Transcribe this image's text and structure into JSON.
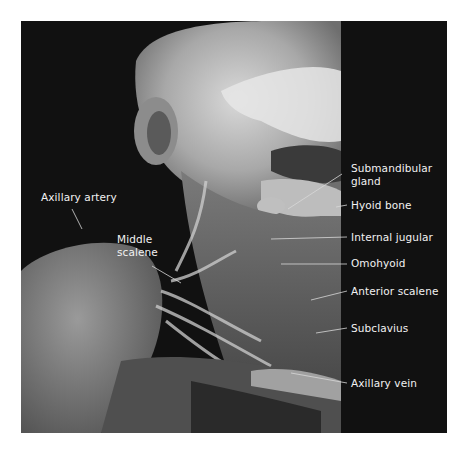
{
  "figure": {
    "colors": {
      "background": "#ffffff",
      "frame": "#111111",
      "label_text": "#f2f2f2",
      "leader_line": "#d8d8d8"
    }
  },
  "labels": [
    {
      "id": "axillary-artery",
      "text": "Axillary artery",
      "side": "left"
    },
    {
      "id": "middle-scalene",
      "line1": "Middle",
      "line2": "scalene",
      "side": "left"
    },
    {
      "id": "submandibular-gland",
      "line1": "Submandibular",
      "line2": "gland",
      "side": "right"
    },
    {
      "id": "hyoid-bone",
      "text": "Hyoid bone",
      "side": "right"
    },
    {
      "id": "internal-jugular",
      "text": "Internal jugular",
      "side": "right"
    },
    {
      "id": "omohyoid",
      "text": "Omohyoid",
      "side": "right"
    },
    {
      "id": "anterior-scalene",
      "text": "Anterior scalene",
      "side": "right"
    },
    {
      "id": "subclavius",
      "text": "Subclavius",
      "side": "right"
    },
    {
      "id": "axillary-vein",
      "text": "Axillary vein",
      "side": "right"
    }
  ]
}
